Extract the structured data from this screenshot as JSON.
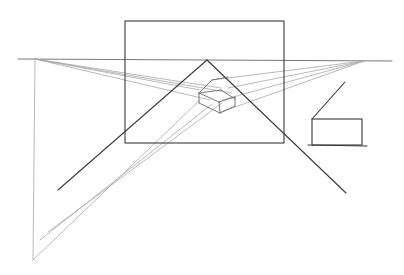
{
  "drawing": {
    "title": "Two-point perspective sketch",
    "background": "#ffffff",
    "horizon": {
      "x1": 18,
      "y1": 59,
      "x2": 392,
      "y2": 61,
      "style": "mid"
    },
    "vanishing_points": [
      {
        "name": "left-vp",
        "x": 35,
        "y": 59
      },
      {
        "name": "right-vp",
        "x": 364,
        "y": 61
      }
    ],
    "frame": {
      "x1": 125,
      "y1": 21,
      "x2": 284,
      "y2": 143,
      "style": "dark"
    },
    "lines": [
      {
        "name": "left-vertical-guide",
        "x1": 35,
        "y1": 59,
        "x2": 33,
        "y2": 260,
        "style": "light"
      },
      {
        "name": "bottom-diagonal-guide-a",
        "x1": 33,
        "y1": 260,
        "x2": 200,
        "y2": 100,
        "style": "light"
      },
      {
        "name": "bottom-diagonal-guide-b",
        "x1": 40,
        "y1": 240,
        "x2": 212,
        "y2": 104,
        "style": "light"
      },
      {
        "name": "bottom-diagonal-guide-c",
        "x1": 48,
        "y1": 232,
        "x2": 222,
        "y2": 103,
        "style": "light"
      },
      {
        "name": "left-vp-ray-1",
        "x1": 35,
        "y1": 59,
        "x2": 200,
        "y2": 90,
        "style": "light"
      },
      {
        "name": "left-vp-ray-2",
        "x1": 35,
        "y1": 59,
        "x2": 210,
        "y2": 100,
        "style": "light"
      },
      {
        "name": "left-vp-ray-3",
        "x1": 35,
        "y1": 59,
        "x2": 221,
        "y2": 88,
        "style": "light"
      },
      {
        "name": "left-vp-ray-4",
        "x1": 35,
        "y1": 59,
        "x2": 232,
        "y2": 93,
        "style": "light"
      },
      {
        "name": "right-vp-ray-1",
        "x1": 364,
        "y1": 61,
        "x2": 212,
        "y2": 80,
        "style": "light"
      },
      {
        "name": "right-vp-ray-2",
        "x1": 364,
        "y1": 61,
        "x2": 222,
        "y2": 100,
        "style": "light"
      },
      {
        "name": "right-vp-ray-3",
        "x1": 364,
        "y1": 61,
        "x2": 221,
        "y2": 112,
        "style": "light"
      },
      {
        "name": "right-vp-ray-4",
        "x1": 364,
        "y1": 61,
        "x2": 228,
        "y2": 88,
        "style": "light"
      },
      {
        "name": "triangle-left-side",
        "x1": 207,
        "y1": 60,
        "x2": 58,
        "y2": 190,
        "style": "dark"
      },
      {
        "name": "triangle-right-side",
        "x1": 207,
        "y1": 60,
        "x2": 346,
        "y2": 193,
        "style": "dark"
      },
      {
        "name": "box-top-front-left",
        "x1": 199,
        "y1": 93,
        "x2": 221,
        "y2": 90,
        "style": "mid"
      },
      {
        "name": "box-top-right",
        "x1": 221,
        "y1": 90,
        "x2": 235,
        "y2": 99,
        "style": "mid"
      },
      {
        "name": "box-top-back-left",
        "x1": 199,
        "y1": 93,
        "x2": 212,
        "y2": 80,
        "style": "mid"
      },
      {
        "name": "box-roof-ridge",
        "x1": 212,
        "y1": 80,
        "x2": 228,
        "y2": 77,
        "style": "mid"
      },
      {
        "name": "box-front-top",
        "x1": 199,
        "y1": 93,
        "x2": 219,
        "y2": 102,
        "style": "mid"
      },
      {
        "name": "box-right-top",
        "x1": 219,
        "y1": 102,
        "x2": 235,
        "y2": 97,
        "style": "mid"
      },
      {
        "name": "box-left-edge",
        "x1": 199,
        "y1": 93,
        "x2": 199,
        "y2": 103,
        "style": "mid"
      },
      {
        "name": "box-center-edge",
        "x1": 219,
        "y1": 102,
        "x2": 220,
        "y2": 113,
        "style": "mid"
      },
      {
        "name": "box-right-edge",
        "x1": 235,
        "y1": 97,
        "x2": 235,
        "y2": 106,
        "style": "mid"
      },
      {
        "name": "box-bottom-left",
        "x1": 199,
        "y1": 103,
        "x2": 220,
        "y2": 113,
        "style": "mid"
      },
      {
        "name": "box-bottom-right",
        "x1": 220,
        "y1": 113,
        "x2": 235,
        "y2": 106,
        "style": "mid"
      },
      {
        "name": "small-box-diagonal",
        "x1": 312,
        "y1": 119,
        "x2": 345,
        "y2": 82,
        "style": "dark"
      },
      {
        "name": "small-box-baseline",
        "x1": 308,
        "y1": 145,
        "x2": 367,
        "y2": 146,
        "style": "dark"
      }
    ],
    "small_box": {
      "x1": 312,
      "y1": 119,
      "x2": 362,
      "y2": 145,
      "style": "dark"
    }
  }
}
